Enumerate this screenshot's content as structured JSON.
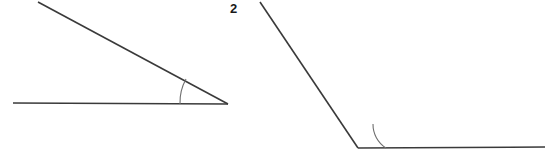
{
  "page": {
    "background_color": "#ffffff",
    "width": 545,
    "height": 152
  },
  "style": {
    "line_color": "#3a3a3a",
    "arc_color": "#6e6e6e",
    "label_color": "#1a1a1a",
    "line_width": 1.6,
    "arc_width": 1.1,
    "label_font_size": "13px"
  },
  "figures": [
    {
      "id": "figure-left",
      "label": "",
      "description": "Acute angle formed by a horizontal ray and a descending slanted ray meeting at the right",
      "vertex": {
        "x": 228,
        "y": 104
      },
      "rays": [
        {
          "name": "horizontal-ray",
          "from": {
            "x": 13,
            "y": 103
          },
          "to": {
            "x": 228,
            "y": 104
          }
        },
        {
          "name": "slanted-ray",
          "from": {
            "x": 38,
            "y": 2
          },
          "to": {
            "x": 228,
            "y": 104
          }
        }
      ],
      "arc": {
        "name": "acute-angle-arc",
        "radius": 48,
        "start": {
          "x": 180,
          "y": 104
        },
        "end": {
          "x": 186,
          "y": 79
        },
        "sweep": 1
      }
    },
    {
      "id": "figure-right",
      "label": "2",
      "description": "Obtuse angle formed by a descending slanted ray from upper left and a horizontal ray extending right from the vertex",
      "vertex": {
        "x": 358,
        "y": 148
      },
      "label_position": {
        "x": 230,
        "y": 2
      },
      "rays": [
        {
          "name": "slanted-ray",
          "from": {
            "x": 260,
            "y": 2
          },
          "to": {
            "x": 358,
            "y": 148
          }
        },
        {
          "name": "horizontal-ray",
          "from": {
            "x": 358,
            "y": 148
          },
          "to": {
            "x": 545,
            "y": 147
          }
        }
      ],
      "arc": {
        "name": "obtuse-angle-arc",
        "radius": 28,
        "start": {
          "x": 386,
          "y": 148
        },
        "end": {
          "x": 373,
          "y": 124
        },
        "sweep": 1
      }
    }
  ]
}
